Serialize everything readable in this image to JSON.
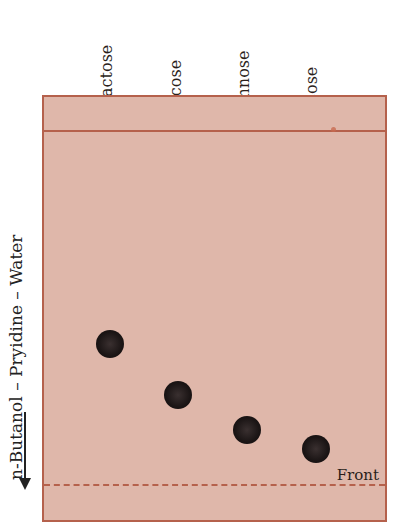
{
  "solvent": {
    "label": "n-Butanol – Pryidine – Water",
    "direction": "down"
  },
  "front": {
    "label": "Front"
  },
  "colors": {
    "paper": "#dfb7aa",
    "border": "#b5614c",
    "spot": "#1b1515",
    "text": "#2a1e1a"
  },
  "samples": [
    {
      "name": "Galactose",
      "origin_x": 108,
      "spot_x": 110,
      "spot_y": 344
    },
    {
      "name": "Glucose",
      "origin_x": 177,
      "spot_x": 178,
      "spot_y": 395
    },
    {
      "name": "Mannose",
      "origin_x": 244,
      "spot_x": 247,
      "spot_y": 430
    },
    {
      "name": "Fucose",
      "origin_x": 312,
      "spot_x": 316,
      "spot_y": 449
    }
  ],
  "labels": {
    "galactose": "oGalactose",
    "glucose": "oGlucose",
    "mannose": "oMannose",
    "fucose": "oFucose"
  }
}
